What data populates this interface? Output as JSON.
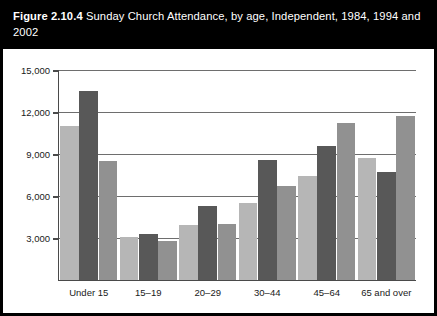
{
  "figure": {
    "label": "Figure 2.10.4",
    "title": "Sunday Church Attendance, by age, Independent, 1984, 1994 and 2002"
  },
  "chart_data": {
    "type": "bar",
    "title": "Sunday Church Attendance, by age, Independent, 1984, 1994 and 2002",
    "xlabel": "",
    "ylabel": "",
    "categories": [
      "Under 15",
      "15–19",
      "20–29",
      "30–44",
      "45–64",
      "65 and over"
    ],
    "series": [
      {
        "name": "1984",
        "color": "#b6b6b6",
        "values": [
          11000,
          3050,
          3900,
          5500,
          7400,
          8700
        ]
      },
      {
        "name": "1994",
        "color": "#585858",
        "values": [
          13500,
          3300,
          5300,
          8600,
          9600,
          7700
        ]
      },
      {
        "name": "2002",
        "color": "#919191",
        "values": [
          8500,
          2800,
          4000,
          6700,
          11200,
          11700
        ]
      }
    ],
    "ylim": [
      0,
      15000
    ],
    "yticks": [
      3000,
      6000,
      9000,
      12000,
      15000
    ],
    "ytick_labels": [
      "3,000",
      "6,000",
      "9,000",
      "12,000",
      "15,000"
    ],
    "grid": true,
    "legend_position": "bottom",
    "legend_entries": [
      "1984",
      "1994",
      "2002"
    ]
  }
}
